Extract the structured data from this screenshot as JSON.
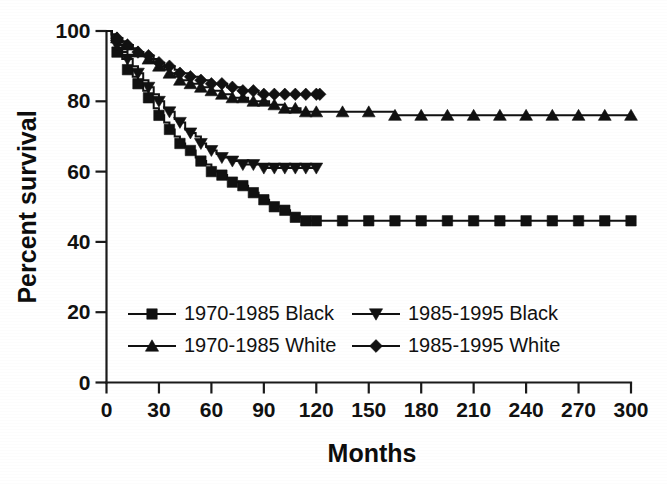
{
  "chart_data": {
    "type": "line",
    "title": "",
    "xlabel": "Months",
    "ylabel": "Percent survival",
    "xlim": [
      0,
      300
    ],
    "ylim": [
      0,
      100
    ],
    "xticks": [
      0,
      30,
      60,
      90,
      120,
      150,
      180,
      210,
      240,
      270,
      300
    ],
    "yticks": [
      0,
      20,
      40,
      60,
      80,
      100
    ],
    "grid": false,
    "legend_position": "lower-left-inside",
    "plot_style": "kaplan-meier step survival curves, black-and-white scanned figure",
    "series": [
      {
        "name": "1970-1985 Black",
        "marker": "square",
        "color": "#111111",
        "plateau_value": 46,
        "last_x": 300,
        "x": [
          0,
          3,
          6,
          9,
          12,
          15,
          18,
          21,
          24,
          27,
          30,
          33,
          36,
          39,
          42,
          45,
          48,
          51,
          54,
          57,
          60,
          63,
          66,
          69,
          72,
          75,
          78,
          81,
          84,
          87,
          90,
          93,
          96,
          99,
          102,
          105,
          108,
          111,
          114,
          117,
          120,
          135,
          150,
          165,
          180,
          195,
          210,
          225,
          240,
          255,
          270,
          285,
          300
        ],
        "y": [
          100,
          97,
          94,
          92,
          89,
          87,
          85,
          83,
          81,
          78,
          76,
          74,
          72,
          70,
          68,
          67,
          66,
          64,
          63,
          62,
          60,
          60,
          59,
          58,
          57,
          57,
          56,
          55,
          54,
          53,
          52,
          51,
          50,
          50,
          49,
          48,
          47,
          47,
          46,
          46,
          46,
          46,
          46,
          46,
          46,
          46,
          46,
          46,
          46,
          46,
          46,
          46,
          46
        ]
      },
      {
        "name": "1970-1985 White",
        "marker": "triangle-up",
        "color": "#111111",
        "plateau_value": 76,
        "last_x": 300,
        "x": [
          0,
          3,
          6,
          9,
          12,
          15,
          18,
          21,
          24,
          27,
          30,
          33,
          36,
          39,
          42,
          45,
          48,
          51,
          54,
          57,
          60,
          63,
          66,
          69,
          72,
          75,
          78,
          81,
          84,
          87,
          90,
          93,
          96,
          99,
          102,
          105,
          108,
          111,
          114,
          117,
          120,
          135,
          150,
          165,
          180,
          195,
          210,
          225,
          240,
          255,
          270,
          285,
          300
        ],
        "y": [
          100,
          99,
          98,
          97,
          96,
          95,
          94,
          93,
          92,
          91,
          90,
          89,
          88,
          87,
          86,
          86,
          85,
          85,
          84,
          84,
          83,
          83,
          82,
          82,
          81,
          81,
          81,
          80,
          80,
          80,
          80,
          79,
          79,
          79,
          78,
          78,
          78,
          77,
          77,
          77,
          77,
          77,
          77,
          76,
          76,
          76,
          76,
          76,
          76,
          76,
          76,
          76,
          76
        ]
      },
      {
        "name": "1985-1995 Black",
        "marker": "triangle-down",
        "color": "#111111",
        "plateau_value": 61,
        "last_x": 120,
        "x": [
          0,
          3,
          6,
          9,
          12,
          15,
          18,
          21,
          24,
          27,
          30,
          33,
          36,
          39,
          42,
          45,
          48,
          51,
          54,
          57,
          60,
          63,
          66,
          69,
          72,
          75,
          78,
          81,
          84,
          87,
          90,
          93,
          96,
          99,
          102,
          105,
          108,
          111,
          114,
          117,
          120
        ],
        "y": [
          100,
          98,
          96,
          94,
          92,
          90,
          88,
          86,
          84,
          82,
          80,
          78,
          77,
          75,
          74,
          72,
          71,
          70,
          68,
          67,
          66,
          65,
          64,
          64,
          63,
          63,
          62,
          62,
          62,
          62,
          61,
          61,
          61,
          61,
          61,
          61,
          61,
          61,
          61,
          61,
          61
        ]
      },
      {
        "name": "1985-1995 White",
        "marker": "diamond",
        "color": "#111111",
        "plateau_value": 82,
        "last_x": 122,
        "x": [
          0,
          3,
          6,
          9,
          12,
          15,
          18,
          21,
          24,
          27,
          30,
          33,
          36,
          39,
          42,
          45,
          48,
          51,
          54,
          57,
          60,
          63,
          66,
          69,
          72,
          75,
          78,
          81,
          84,
          87,
          90,
          93,
          96,
          99,
          102,
          105,
          108,
          111,
          114,
          117,
          120,
          122
        ],
        "y": [
          100,
          99,
          98,
          97,
          96,
          95,
          94,
          93,
          93,
          92,
          91,
          90,
          90,
          89,
          88,
          88,
          87,
          87,
          86,
          86,
          85,
          85,
          85,
          84,
          84,
          84,
          83,
          83,
          83,
          82,
          82,
          82,
          82,
          82,
          82,
          82,
          82,
          82,
          82,
          82,
          82,
          82
        ]
      }
    ]
  },
  "axes": {
    "ylabel": "Percent survival",
    "xlabel": "Months",
    "ytick_labels": [
      "0",
      "20",
      "40",
      "60",
      "80",
      "100"
    ],
    "xtick_labels": [
      "0",
      "30",
      "60",
      "90",
      "120",
      "150",
      "180",
      "210",
      "240",
      "270",
      "300"
    ]
  },
  "legend": {
    "entries": [
      {
        "label": "1970-1985 Black",
        "marker": "square"
      },
      {
        "label": "1985-1995 Black",
        "marker": "triangle-down"
      },
      {
        "label": "1970-1985 White",
        "marker": "triangle-up"
      },
      {
        "label": "1985-1995 White",
        "marker": "diamond"
      }
    ]
  },
  "colors": {
    "ink": "#111111",
    "paper": "#ffffff"
  }
}
